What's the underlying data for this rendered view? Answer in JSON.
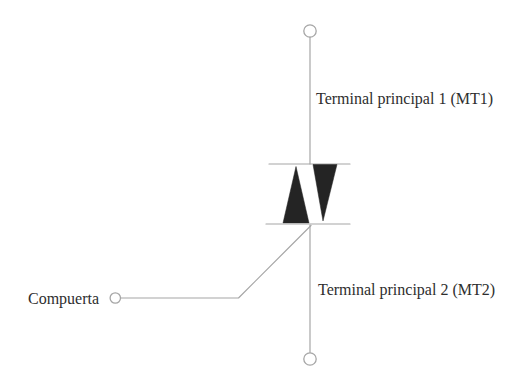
{
  "diagram": {
    "type": "triac-schematic",
    "labels": {
      "terminal1": "Terminal principal 1 (MT1)",
      "terminal2": "Terminal principal 2 (MT2)",
      "gate": "Compuerta"
    },
    "colors": {
      "background": "#ffffff",
      "line": "#a6a6a6",
      "triangle": "#242424",
      "text": "#2e2e2e"
    }
  }
}
